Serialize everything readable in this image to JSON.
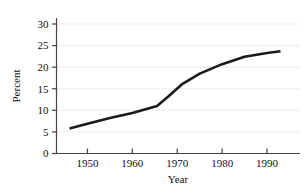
{
  "chart_data": {
    "type": "line",
    "title": "",
    "subtitle": "",
    "xlabel": "Year",
    "ylabel": "Percent",
    "xlim": [
      1943.1,
      1996.9
    ],
    "ylim": [
      0,
      31.2
    ],
    "xticks": [
      1950,
      1960,
      1970,
      1980,
      1990
    ],
    "xtick_labels": [
      "1950",
      "1960",
      "1970",
      "1980",
      "1990"
    ],
    "yticks": [
      0,
      5,
      10,
      15,
      20,
      25,
      30
    ],
    "ytick_labels": [
      "0",
      "5",
      "10",
      "15",
      "20",
      "25",
      "30"
    ],
    "grid": {
      "horizontal": true,
      "vertical": false,
      "color": "#ebebeb"
    },
    "legend": {
      "visible": false,
      "position": "none",
      "entries": []
    },
    "annotations": [],
    "series": [
      {
        "name": "Percent",
        "color": "#1a1a1a",
        "line_width": 2.6,
        "markers": false,
        "x": [
          1946.0,
          1950.0,
          1955.0,
          1960.0,
          1965.5,
          1968.0,
          1971.0,
          1975.0,
          1980.0,
          1985.0,
          1990.0,
          1993.0
        ],
        "values": [
          5.8,
          6.9,
          8.2,
          9.4,
          11.0,
          13.2,
          16.0,
          18.5,
          20.7,
          22.4,
          23.3,
          23.7
        ]
      }
    ]
  }
}
